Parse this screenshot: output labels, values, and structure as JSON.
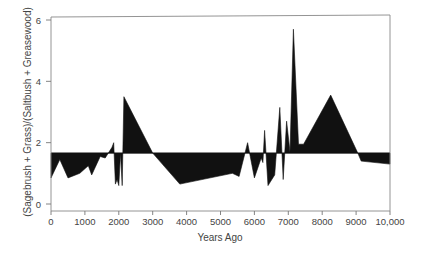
{
  "chart_data": {
    "type": "area",
    "title": "",
    "xlabel": "Years Ago",
    "ylabel": "(Sagebrush + Grass)/(Saltbush + Greasewood)",
    "xlim": [
      0,
      10000
    ],
    "ylim": [
      0,
      6
    ],
    "x_ticks": [
      0,
      1000,
      2000,
      3000,
      4000,
      5000,
      6000,
      7000,
      8000,
      9000,
      10000
    ],
    "x_tick_labels": [
      "0",
      "1000",
      "2000",
      "3000",
      "4000",
      "5000",
      "6000",
      "7000",
      "8000",
      "9000",
      "10,000"
    ],
    "y_ticks": [
      0,
      2,
      4,
      6
    ],
    "y_tick_labels": [
      "0",
      "2",
      "4",
      "6"
    ],
    "baseline": 1.66,
    "grid": false,
    "legend": null,
    "fill_color": "#111111",
    "series": [
      {
        "name": "ratio",
        "x": [
          0,
          260,
          500,
          850,
          1100,
          1200,
          1450,
          1600,
          1800,
          1850,
          1900,
          1950,
          2000,
          2050,
          2100,
          2150,
          3000,
          3800,
          5350,
          5550,
          5800,
          6000,
          6200,
          6250,
          6300,
          6400,
          6600,
          6750,
          6850,
          6950,
          7050,
          7150,
          7300,
          7450,
          8250,
          9050,
          9150,
          10000
        ],
        "values": [
          0.85,
          1.45,
          0.85,
          1.0,
          1.25,
          0.95,
          1.55,
          1.5,
          1.85,
          2.0,
          0.65,
          0.8,
          0.6,
          1.66,
          0.6,
          3.5,
          1.66,
          0.65,
          1.0,
          0.9,
          2.0,
          0.85,
          1.5,
          1.35,
          2.4,
          0.6,
          0.95,
          3.15,
          0.8,
          2.7,
          1.7,
          5.7,
          1.95,
          1.95,
          3.55,
          1.66,
          1.4,
          1.3
        ]
      }
    ]
  }
}
